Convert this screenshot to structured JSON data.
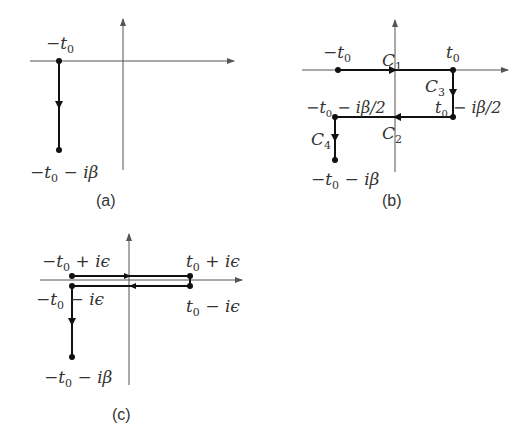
{
  "figure": {
    "panels": [
      {
        "id": "a",
        "caption": "(a)",
        "labels": {
          "start": {
            "main": "−t",
            "sub": "0",
            "rest": ""
          },
          "end": {
            "main": "−t",
            "sub": "0",
            "rest": " − iβ"
          }
        }
      },
      {
        "id": "b",
        "caption": "(b)",
        "labels": {
          "start": {
            "main": "−t",
            "sub": "0",
            "rest": ""
          },
          "right": {
            "main": "t",
            "sub": "0",
            "rest": ""
          },
          "right_mid": {
            "main": "t",
            "sub": "0",
            "rest": " − iβ/2"
          },
          "left_mid": {
            "main": "−t",
            "sub": "0",
            "rest": " − iβ/2"
          },
          "end": {
            "main": "−t",
            "sub": "0",
            "rest": " − iβ"
          },
          "c1": {
            "main": "C",
            "sub": "1"
          },
          "c2": {
            "main": "C",
            "sub": "2"
          },
          "c3": {
            "main": "C",
            "sub": "3"
          },
          "c4": {
            "main": "C",
            "sub": "4"
          }
        }
      },
      {
        "id": "c",
        "caption": "(c)",
        "labels": {
          "top_left": {
            "main": "−t",
            "sub": "0",
            "rest": " + iϵ"
          },
          "top_right": {
            "main": "t",
            "sub": "0",
            "rest": " + iϵ"
          },
          "bottom_left": {
            "main": "−t",
            "sub": "0",
            "rest": " − iϵ"
          },
          "bottom_right": {
            "main": "t",
            "sub": "0",
            "rest": " − iϵ"
          },
          "end": {
            "main": "−t",
            "sub": "0",
            "rest": " − iβ"
          }
        }
      }
    ]
  },
  "colors": {
    "axis": "#555555",
    "contour": "#111111",
    "text": "#333333",
    "background": "#ffffff"
  }
}
